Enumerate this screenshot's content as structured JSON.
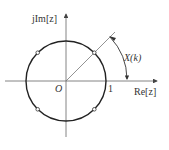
{
  "diagram": {
    "axes": {
      "imag_label": "jIm[z]",
      "real_label": "Re[z]",
      "origin_label": "O",
      "unit_label": "1"
    },
    "angle_label": "X(k)",
    "sample_points": [
      {
        "angle_deg": 45
      },
      {
        "angle_deg": 135
      },
      {
        "angle_deg": 225
      },
      {
        "angle_deg": 315
      }
    ],
    "colors": {
      "circle": "#222222",
      "axes": "#555555",
      "text": "#333333",
      "background": "#ffffff"
    }
  }
}
